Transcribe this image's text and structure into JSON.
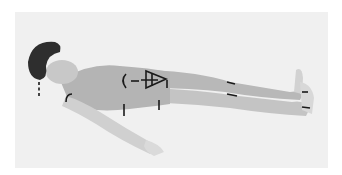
{
  "image": {
    "subject": "person lying supine with annotation arrows",
    "style": "grayscale photograph",
    "colors": {
      "page_background": "#ffffff",
      "photo_background": "#f0f0f0",
      "skin": "#bdbdbd",
      "hair": "#2e2e2e",
      "annotation": "#1a1a1a"
    },
    "annotations": [
      "dashed-arrow-neck",
      "arc-shoulder",
      "arc-torso",
      "triangle-pelvis",
      "arrow-hip-down",
      "arrow-waist-down",
      "arrow-thigh-left",
      "arrow-knee-left",
      "arrow-ankle-left",
      "arrow-foot-left"
    ]
  }
}
